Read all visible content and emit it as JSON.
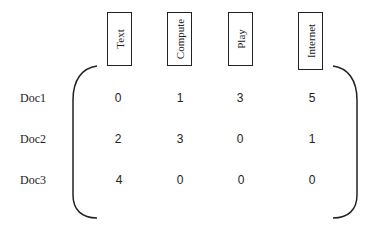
{
  "matrix": {
    "columns": [
      "Text",
      "Compute",
      "Play",
      "Internet"
    ],
    "rows": [
      {
        "label": "Doc1",
        "values": [
          "0",
          "1",
          "3",
          "5"
        ]
      },
      {
        "label": "Doc2",
        "values": [
          "2",
          "3",
          "0",
          "1"
        ]
      },
      {
        "label": "Doc3",
        "values": [
          "4",
          "0",
          "0",
          "0"
        ]
      }
    ]
  }
}
